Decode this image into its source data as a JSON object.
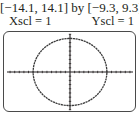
{
  "header": {
    "window": "[−14.1, 14.1] by [−9.3, 9.3]",
    "xscl": "Xscl = 1",
    "yscl": "Yscl = 1"
  },
  "chart_data": {
    "type": "line",
    "xlabel": "",
    "ylabel": "",
    "xlim": [
      -14.1,
      14.1
    ],
    "ylim": [
      -9.3,
      9.3
    ],
    "xscl": 1,
    "yscl": 1,
    "grid": false,
    "legend": null,
    "annotations": [
      "Xscl = 1",
      "Yscl = 1"
    ],
    "series": [
      {
        "name": "circle",
        "description": "Circle centered at origin, radius approx 8 (graphing calculator screen, square window)",
        "center": [
          0,
          0
        ],
        "radius": 8,
        "x": [
          8,
          5.66,
          0,
          -5.66,
          -8,
          -5.66,
          0,
          5.66,
          8
        ],
        "y": [
          0,
          5.66,
          8,
          5.66,
          0,
          -5.66,
          -8,
          -5.66,
          0
        ]
      }
    ]
  },
  "plot": {
    "frame_color": "#4a4a4a",
    "axis_color": "#231f20",
    "curve_color": "#3a3a3a"
  },
  "caption": {
    "text": ""
  }
}
